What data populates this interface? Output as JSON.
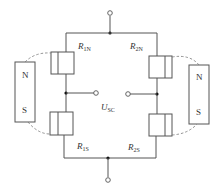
{
  "diagram": {
    "type": "wheatstone-bridge-magnetoresistor",
    "resistors": [
      {
        "id": "R1N",
        "symbol": "R",
        "subscript": "1N"
      },
      {
        "id": "R2N",
        "symbol": "R",
        "subscript": "2N"
      },
      {
        "id": "R1S",
        "symbol": "R",
        "subscript": "1S"
      },
      {
        "id": "R2S",
        "symbol": "R",
        "subscript": "2S"
      }
    ],
    "output": {
      "symbol": "U",
      "subscript": "SC"
    },
    "magnets": [
      {
        "side": "left",
        "north": "N",
        "south": "S"
      },
      {
        "side": "right",
        "north": "N",
        "south": "S"
      }
    ]
  }
}
